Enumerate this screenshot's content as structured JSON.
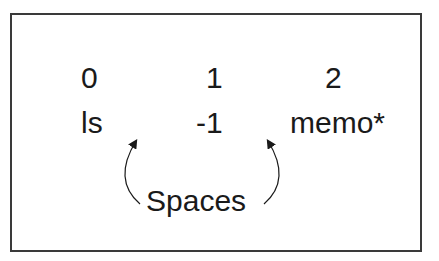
{
  "diagram": {
    "indices": [
      "0",
      "1",
      "2"
    ],
    "values": [
      "ls",
      "-1",
      "memo*"
    ],
    "annotation": "Spaces",
    "colors": {
      "border": "#3a3a3a",
      "text": "#1a1a1a",
      "background": "#ffffff"
    }
  }
}
